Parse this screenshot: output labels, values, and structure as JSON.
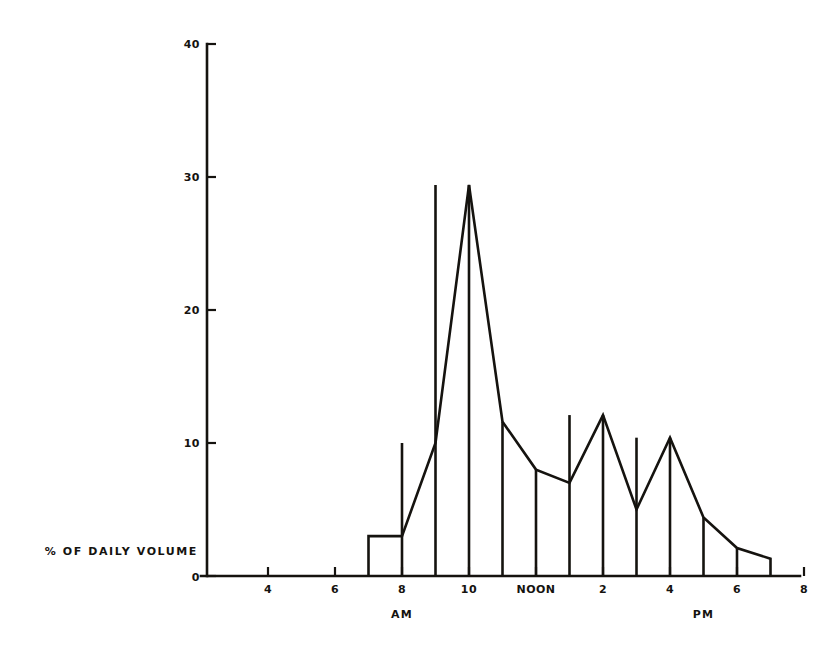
{
  "chart_data": {
    "type": "bar",
    "title": "",
    "subtitle": "",
    "xlabel": "",
    "ylabel": "% OF DAILY VOLUME",
    "categories": [
      "7-8 AM",
      "8-9 AM",
      "9-10 AM",
      "10-11 AM",
      "11 AM-NOON",
      "NOON-1 PM",
      "1-2 PM",
      "2-3 PM",
      "3-4 PM",
      "4-5 PM",
      "5-6 PM",
      "6-7 PM"
    ],
    "bin_starts": [
      7,
      8,
      9,
      10,
      11,
      12,
      13,
      14,
      15,
      16,
      17,
      18
    ],
    "bin_ends": [
      8,
      9,
      10,
      11,
      12,
      13,
      14,
      15,
      16,
      17,
      18,
      19
    ],
    "values": [
      3.0,
      10.0,
      29.4,
      11.6,
      8.0,
      7.0,
      12.1,
      5.0,
      10.4,
      4.4,
      2.1,
      1.3
    ],
    "series": [
      {
        "name": "% of daily volume",
        "values": [
          3.0,
          10.0,
          29.4,
          11.6,
          8.0,
          7.0,
          12.1,
          5.0,
          10.4,
          4.4,
          2.1,
          1.3
        ]
      }
    ],
    "xlim": [
      3,
      20
    ],
    "ylim": [
      0,
      40
    ],
    "grid": false,
    "legend": false,
    "legend_position": "none",
    "bar_style": "outline",
    "bar_fill": "#ffffff",
    "bar_stroke": "#15130f"
  },
  "axes": {
    "y": {
      "label": "% OF DAILY VOLUME",
      "ticks": [
        {
          "value": 0,
          "label": "0"
        },
        {
          "value": 10,
          "label": "10"
        },
        {
          "value": 20,
          "label": "20"
        },
        {
          "value": 30,
          "label": "30"
        },
        {
          "value": 40,
          "label": "40"
        }
      ],
      "min": 0,
      "max": 40
    },
    "x": {
      "label": "",
      "ticks": [
        {
          "value": 4,
          "label": "4"
        },
        {
          "value": 6,
          "label": "6"
        },
        {
          "value": 8,
          "label": "8"
        },
        {
          "value": 10,
          "label": "10"
        },
        {
          "value": 12,
          "label": "NOON"
        },
        {
          "value": 14,
          "label": "2"
        },
        {
          "value": 16,
          "label": "4"
        },
        {
          "value": 18,
          "label": "6"
        },
        {
          "value": 20,
          "label": "8"
        }
      ],
      "origin_label": "0",
      "min": 3,
      "max": 20,
      "period_labels": [
        {
          "value": 8,
          "label": "AM"
        },
        {
          "value": 17,
          "label": "PM"
        }
      ]
    }
  },
  "colors": {
    "ink": "#15130f",
    "background": "#ffffff"
  }
}
